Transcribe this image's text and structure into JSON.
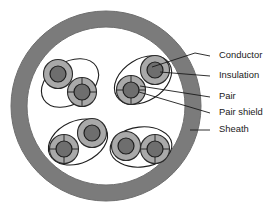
{
  "figure": {
    "background": "#ffffff"
  },
  "colors": {
    "sheath_fill": "#7b7b7b",
    "sheath_stroke": "#6e6e6e",
    "core_fill": "#ffffff",
    "insulation_fill": "#a9a9a9",
    "insulation_stroke": "#2b2b2b",
    "conductor_fill": "#6e6e6e",
    "conductor_stroke": "#1f1f1f",
    "pair_shield_stroke": "#1f1f1f",
    "pair_shield_fill": "#ffffff",
    "leader_line": "#1a1a1a",
    "label_text": "#1a1a1a"
  },
  "sheath": {
    "label": "Sheath",
    "center_x": 106,
    "center_y": 106,
    "outer_radius": 95,
    "inner_radius": 79
  },
  "labels": [
    {
      "id": "conductor",
      "text": "Conductor",
      "x": 219,
      "y": 56
    },
    {
      "id": "insulation",
      "text": "Insulation",
      "x": 219,
      "y": 76
    },
    {
      "id": "pair",
      "text": "Pair",
      "x": 219,
      "y": 97
    },
    {
      "id": "pair-shield",
      "text": "Pair shield",
      "x": 219,
      "y": 113
    },
    {
      "id": "sheath",
      "text": "Sheath",
      "x": 219,
      "y": 130
    }
  ],
  "leaders": [
    {
      "id": "leader-conductor",
      "points": "210,56 195,53 152,67"
    },
    {
      "id": "leader-insulation",
      "points": "210,76 160,72"
    },
    {
      "id": "leader-pair",
      "points": "210,97 140,86"
    },
    {
      "id": "leader-pair-shield",
      "points": "210,113 139,92"
    },
    {
      "id": "leader-sheath",
      "points": "210,130 190,130"
    }
  ],
  "pairs": [
    {
      "id": "pair-upper-left",
      "shield": {
        "cx": 70,
        "cy": 83,
        "rx": 31,
        "ry": 21,
        "rotate": -32
      },
      "conductors": [
        {
          "cx": 58,
          "cy": 74,
          "r_ins": 14.5,
          "r_cond": 8.0,
          "crosshair": false
        },
        {
          "cx": 82,
          "cy": 92,
          "r_ins": 14.5,
          "r_cond": 8.0,
          "crosshair": true
        }
      ]
    },
    {
      "id": "pair-upper-right",
      "shield": {
        "cx": 143,
        "cy": 80,
        "rx": 31,
        "ry": 21,
        "rotate": -32
      },
      "conductors": [
        {
          "cx": 155,
          "cy": 70,
          "r_ins": 14.5,
          "r_cond": 8.0,
          "crosshair": false
        },
        {
          "cx": 131,
          "cy": 90,
          "r_ins": 14.5,
          "r_cond": 8.0,
          "crosshair": true
        }
      ]
    },
    {
      "id": "pair-lower-left",
      "shield": {
        "cx": 78,
        "cy": 142,
        "rx": 31,
        "ry": 21,
        "rotate": -24
      },
      "conductors": [
        {
          "cx": 92,
          "cy": 133,
          "r_ins": 14.5,
          "r_cond": 8.0,
          "crosshair": false
        },
        {
          "cx": 64,
          "cy": 149,
          "r_ins": 14.5,
          "r_cond": 8.0,
          "crosshair": true
        }
      ]
    },
    {
      "id": "pair-lower-right",
      "shield": {
        "cx": 141,
        "cy": 147,
        "rx": 31,
        "ry": 20,
        "rotate": -6
      },
      "conductors": [
        {
          "cx": 126,
          "cy": 146,
          "r_ins": 14.5,
          "r_cond": 8.0,
          "crosshair": false
        },
        {
          "cx": 155,
          "cy": 149,
          "r_ins": 14.5,
          "r_cond": 8.0,
          "crosshair": true
        }
      ]
    }
  ]
}
